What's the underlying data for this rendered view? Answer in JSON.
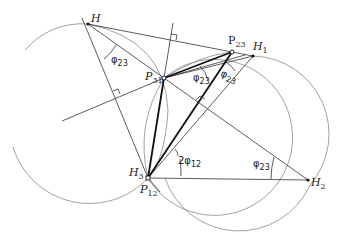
{
  "figure": {
    "points": {
      "H": {
        "label": "H",
        "sub": ""
      },
      "H1": {
        "label": "H",
        "sub": "1"
      },
      "H2": {
        "label": "H",
        "sub": "2"
      },
      "H3": {
        "label": "H",
        "sub": "3"
      },
      "P12": {
        "label": "P",
        "sub": "12"
      },
      "P23": {
        "label": "P",
        "sub": "23"
      },
      "P31": {
        "label": "P",
        "sub": "31"
      }
    },
    "angles": {
      "a1": {
        "symbol": "φ",
        "sub": "23"
      },
      "a2": {
        "symbol": "φ",
        "sub": "23"
      },
      "a3": {
        "symbol": "φ",
        "sub": "23"
      },
      "a4": {
        "symbol": "φ",
        "sub": "23"
      },
      "a5": {
        "symbol": "2φ",
        "sub": "12"
      }
    }
  }
}
